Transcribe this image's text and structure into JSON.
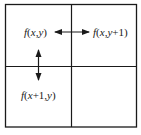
{
  "diagram": {
    "type": "2x2 grid",
    "cells": [
      {
        "position": "top-left",
        "label": "f(x,y)"
      },
      {
        "position": "top-right",
        "label": "f(x,y+1)"
      },
      {
        "position": "bottom-left",
        "label": "f(x+1,y)"
      },
      {
        "position": "bottom-right",
        "label": ""
      }
    ],
    "arrows": [
      {
        "from": "f(x,y)",
        "to": "f(x,y+1)",
        "direction": "horizontal",
        "bidirectional": true
      },
      {
        "from": "f(x,y)",
        "to": "f(x+1,y)",
        "direction": "vertical",
        "bidirectional": true
      }
    ],
    "colors": {
      "line": "#1a1a1a",
      "background": "#ffffff"
    }
  },
  "labels": {
    "tl": "f(x,y)",
    "tr": "f(x,y+1)",
    "bl": "f(x+1,y)"
  }
}
